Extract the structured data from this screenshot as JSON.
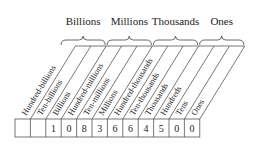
{
  "diagram": {
    "groups": [
      {
        "label": "Billions",
        "start": 0,
        "end": 3
      },
      {
        "label": "Millions",
        "start": 3,
        "end": 6
      },
      {
        "label": "Thousands",
        "start": 6,
        "end": 9
      },
      {
        "label": "Ones",
        "start": 9,
        "end": 12
      }
    ],
    "columns": [
      {
        "label": "Hundred-billions",
        "digit": ""
      },
      {
        "label": "Ten-billions",
        "digit": ""
      },
      {
        "label": "Billions",
        "digit": "1"
      },
      {
        "label": "Hundred-millions",
        "digit": "0"
      },
      {
        "label": "Ten-millions",
        "digit": "8"
      },
      {
        "label": "Millions",
        "digit": "3"
      },
      {
        "label": "Hundred-thousands",
        "digit": "6"
      },
      {
        "label": "Ten-thousands",
        "digit": "6"
      },
      {
        "label": "Thousands",
        "digit": "4"
      },
      {
        "label": "Hundreds",
        "digit": "5"
      },
      {
        "label": "Tens",
        "digit": "0"
      },
      {
        "label": "Ones",
        "digit": "0"
      }
    ],
    "number": "1,083,664,500"
  }
}
